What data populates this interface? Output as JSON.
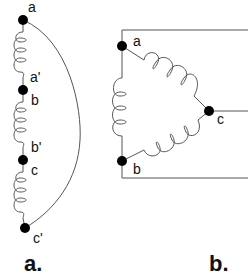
{
  "diagram_a": {
    "caption": "a.",
    "terminals": [
      {
        "label": "a",
        "x": 23,
        "y": 20
      },
      {
        "label": "a'",
        "label2": "b",
        "x": 23,
        "y": 90
      },
      {
        "label": "b'",
        "label2": "c",
        "x": 23,
        "y": 160
      },
      {
        "label": "c'",
        "x": 25,
        "y": 228
      }
    ]
  },
  "diagram_b": {
    "caption": "b.",
    "terminals": [
      {
        "label": "a",
        "x": 122,
        "y": 46
      },
      {
        "label": "c",
        "x": 209,
        "y": 111
      },
      {
        "label": "b",
        "x": 122,
        "y": 161
      }
    ]
  },
  "colors": {
    "line": "#555555",
    "dot": "#000000",
    "text": "#111111"
  }
}
